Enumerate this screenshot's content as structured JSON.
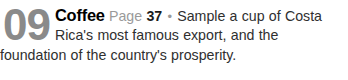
{
  "listing": {
    "item_number": "09",
    "title": "Coffee",
    "page_label": "Page",
    "page_number": "37",
    "separator": "•",
    "description": "Sample a cup of Costa Rica's most famous export, and the foundation of the country's prosperity.",
    "full_text": "09 Coffee Page 37 • Sample a cup of Costa Rica's most famous export, and the foundation of the country's prosperity.",
    "colors": {
      "item_number": "#8a8a8a",
      "title": "#000000",
      "page_label": "#9a9a9a",
      "page_number": "#1c1c1c",
      "separator": "#9a9a9a",
      "description": "#2f2f2f",
      "background": "#ffffff"
    }
  }
}
